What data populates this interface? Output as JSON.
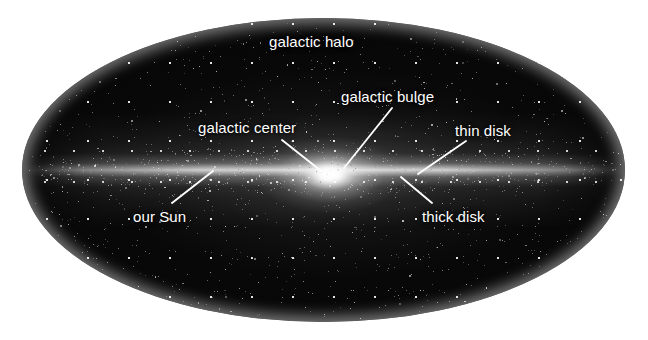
{
  "diagram": {
    "background_color": "#ffffff",
    "galaxy_color": "#070707",
    "label_color": "#ffffff",
    "leader_line_color": "#ffffff",
    "shape": "ellipse",
    "labels": [
      {
        "id": "galactic-halo",
        "text": "galactic halo",
        "x": 269,
        "y": 34,
        "has_leader": false
      },
      {
        "id": "galactic-bulge",
        "text": "galactic bulge",
        "x": 341,
        "y": 89,
        "has_leader": true
      },
      {
        "id": "galactic-center",
        "text": "galactic center",
        "x": 198,
        "y": 120,
        "has_leader": true
      },
      {
        "id": "thin-disk",
        "text": "thin disk",
        "x": 455,
        "y": 123,
        "has_leader": true
      },
      {
        "id": "our-Sun",
        "text": "our Sun",
        "x": 133,
        "y": 209,
        "has_leader": true
      },
      {
        "id": "thick-disk",
        "text": "thick disk",
        "x": 422,
        "y": 209,
        "has_leader": true
      }
    ],
    "leaders": [
      {
        "id": "leader-galactic-bulge",
        "x1": 392,
        "y1": 108,
        "x2": 344,
        "y2": 168
      },
      {
        "id": "leader-galactic-center",
        "x1": 282,
        "y1": 140,
        "x2": 330,
        "y2": 178
      },
      {
        "id": "leader-thin-disk",
        "x1": 466,
        "y1": 141,
        "x2": 418,
        "y2": 174
      },
      {
        "id": "leader-our-Sun",
        "x1": 172,
        "y1": 203,
        "x2": 213,
        "y2": 171
      },
      {
        "id": "leader-thick-disk",
        "x1": 401,
        "y1": 177,
        "x2": 432,
        "y2": 203
      }
    ],
    "structures": [
      {
        "name": "galactic halo",
        "description": "diffuse spheroidal star cloud enclosing the whole galaxy"
      },
      {
        "name": "galactic bulge",
        "description": "dense oblate swelling of stars around the centre"
      },
      {
        "name": "galactic center",
        "description": "brightest point at the middle of the bulge"
      },
      {
        "name": "thin disk",
        "description": "narrow bright plane of stars"
      },
      {
        "name": "thick disk",
        "description": "broader fainter plane surrounding the thin disk"
      },
      {
        "name": "our Sun",
        "description": "marked position in the disk, left of centre"
      }
    ]
  }
}
